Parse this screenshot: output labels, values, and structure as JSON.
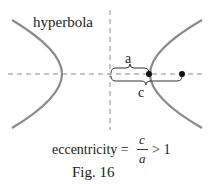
{
  "title_label": "hyperbola",
  "label_a": "a",
  "label_c": "c",
  "formula": {
    "lhs": "eccentricity =",
    "numerator": "c",
    "denominator": "a",
    "rhs": "> 1"
  },
  "caption": "Fig. 16",
  "colors": {
    "curve": "#8a8a8a",
    "axis": "#777777",
    "text": "#222222",
    "point": "#111111"
  }
}
